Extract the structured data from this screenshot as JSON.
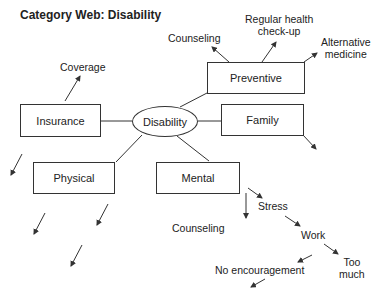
{
  "title": "Category Web: Disability",
  "center": {
    "label": "Disability"
  },
  "nodes": {
    "insurance": "Insurance",
    "preventive": "Preventive",
    "family": "Family",
    "physical": "Physical",
    "mental": "Mental"
  },
  "leaves": {
    "coverage": "Coverage",
    "counseling_top": "Counseling",
    "regular_line1": "Regular health",
    "regular_line2": "check-up",
    "alt_line1": "Alternative",
    "alt_line2": "medicine",
    "counseling_bottom": "Counseling",
    "stress": "Stress",
    "work": "Work",
    "too_line1": "Too",
    "too_line2": "much",
    "no_encouragement": "No encouragement"
  },
  "colors": {
    "stroke": "#333333",
    "text": "#222222",
    "background": "#ffffff"
  }
}
